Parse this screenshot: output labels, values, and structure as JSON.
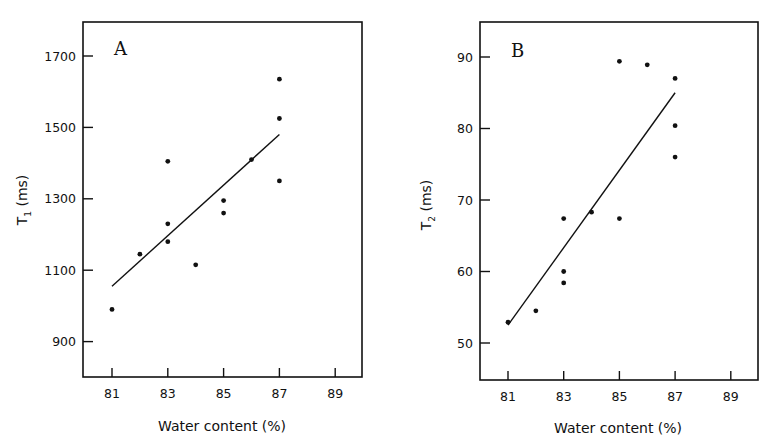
{
  "chart_data": [
    {
      "type": "scatter",
      "panel": "A",
      "title": "",
      "xlabel": "Water content (%)",
      "ylabel": "T1 (ms)",
      "ylabel_main": "T",
      "ylabel_sub": "1",
      "ylabel_unit": "(ms)",
      "xlim": [
        80.2,
        90
      ],
      "ylim": [
        790,
        1795
      ],
      "xticks": [
        81,
        83,
        85,
        87,
        89
      ],
      "yticks": [
        900,
        1100,
        1300,
        1500,
        1700
      ],
      "grid": false,
      "points": [
        {
          "x": 81,
          "y": 990
        },
        {
          "x": 82,
          "y": 1145
        },
        {
          "x": 83,
          "y": 1405
        },
        {
          "x": 83,
          "y": 1230
        },
        {
          "x": 83,
          "y": 1180
        },
        {
          "x": 84,
          "y": 1115
        },
        {
          "x": 85,
          "y": 1295
        },
        {
          "x": 85,
          "y": 1260
        },
        {
          "x": 86,
          "y": 1410
        },
        {
          "x": 87,
          "y": 1635
        },
        {
          "x": 87,
          "y": 1525
        },
        {
          "x": 87,
          "y": 1350
        }
      ],
      "fit_line": {
        "x": [
          81,
          87
        ],
        "y": [
          1055,
          1480
        ]
      }
    },
    {
      "type": "scatter",
      "panel": "B",
      "title": "",
      "xlabel": "Water content (%)",
      "ylabel": "T2 (ms)",
      "ylabel_main": "T",
      "ylabel_sub": "2",
      "ylabel_unit": "(ms)",
      "xlim": [
        80.2,
        90
      ],
      "ylim": [
        45.2,
        95
      ],
      "xticks": [
        81,
        83,
        85,
        87,
        89
      ],
      "yticks": [
        50,
        60,
        70,
        80,
        90
      ],
      "grid": false,
      "points": [
        {
          "x": 81,
          "y": 52.9
        },
        {
          "x": 82,
          "y": 54.5
        },
        {
          "x": 83,
          "y": 67.4
        },
        {
          "x": 83,
          "y": 60.0
        },
        {
          "x": 83,
          "y": 58.4
        },
        {
          "x": 84,
          "y": 68.3
        },
        {
          "x": 85,
          "y": 89.4
        },
        {
          "x": 85,
          "y": 67.4
        },
        {
          "x": 86,
          "y": 88.9
        },
        {
          "x": 87,
          "y": 87.0
        },
        {
          "x": 87,
          "y": 80.4
        },
        {
          "x": 87,
          "y": 76.0
        }
      ],
      "fit_line": {
        "x": [
          81,
          87
        ],
        "y": [
          52.5,
          85.0
        ]
      }
    }
  ],
  "panels": {
    "a": {
      "letter": "A",
      "xlabel": "Water content (%)",
      "ylabel_main": "T",
      "ylabel_sub": "1",
      "ylabel_unit": "(ms)"
    },
    "b": {
      "letter": "B",
      "xlabel": "Water content (%)",
      "ylabel_main": "T",
      "ylabel_sub": "2",
      "ylabel_unit": "(ms)"
    }
  },
  "style": {
    "ink": "#111111",
    "background": "#ffffff"
  }
}
